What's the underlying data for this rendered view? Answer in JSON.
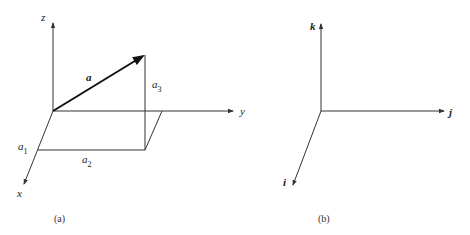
{
  "panel_a": {
    "caption": "(a)",
    "axes": {
      "z_label": "z",
      "y_label": "y",
      "x_label": "x"
    },
    "vector_label": "a",
    "components": {
      "a1": {
        "base": "a",
        "sub": "1"
      },
      "a2": {
        "base": "a",
        "sub": "2"
      },
      "a3": {
        "base": "a",
        "sub": "3"
      }
    }
  },
  "panel_b": {
    "caption": "(b)",
    "axes": {
      "k_label": "k",
      "j_label": "j",
      "i_label": "i"
    }
  },
  "colors": {
    "stroke": "#333333",
    "vector": "#111111",
    "background": "#ffffff"
  }
}
